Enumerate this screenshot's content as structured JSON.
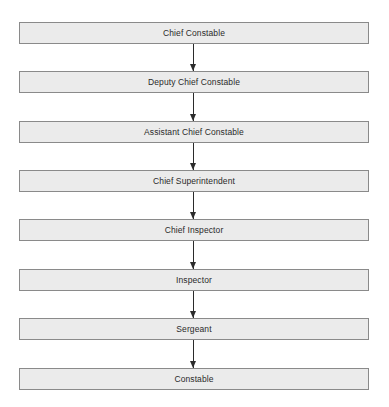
{
  "diagram": {
    "type": "hierarchy-flowchart",
    "direction": "top-to-bottom",
    "nodes": [
      {
        "label": "Chief Constable"
      },
      {
        "label": "Deputy Chief Constable"
      },
      {
        "label": "Assistant Chief Constable"
      },
      {
        "label": "Chief Superintendent"
      },
      {
        "label": "Chief Inspector"
      },
      {
        "label": "Inspector"
      },
      {
        "label": "Sergeant"
      },
      {
        "label": "Constable"
      }
    ],
    "edges": [
      {
        "from": "Chief Constable",
        "to": "Deputy Chief Constable"
      },
      {
        "from": "Deputy Chief Constable",
        "to": "Assistant Chief Constable"
      },
      {
        "from": "Assistant Chief Constable",
        "to": "Chief Superintendent"
      },
      {
        "from": "Chief Superintendent",
        "to": "Chief Inspector"
      },
      {
        "from": "Chief Inspector",
        "to": "Inspector"
      },
      {
        "from": "Inspector",
        "to": "Sergeant"
      },
      {
        "from": "Sergeant",
        "to": "Constable"
      }
    ],
    "colors": {
      "node_fill": "#ebebeb",
      "node_border": "#8a8a8a",
      "arrow": "#2b2b2b",
      "text": "#2a2a2a"
    }
  }
}
